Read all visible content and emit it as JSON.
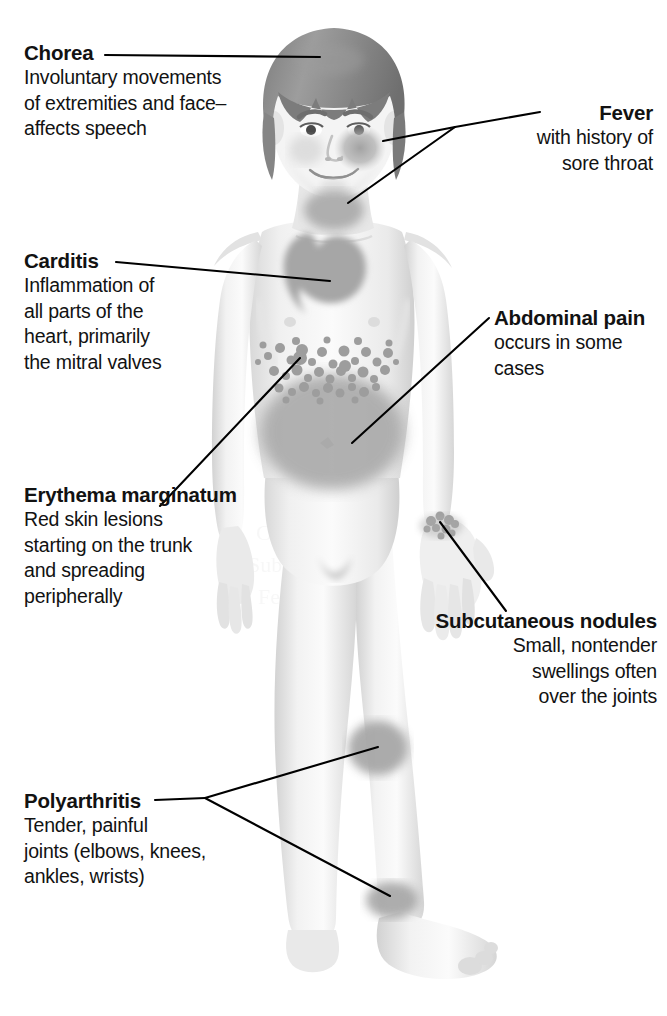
{
  "diagram": {
    "style": "grayscale medical illustration with leader-line callouts",
    "background_color": "#ffffff",
    "text_color": "#121212",
    "leader_line_color": "#000000",
    "patch_color": "#a9a9a9",
    "skin_color": "#f2f2f2",
    "hair_color": "#8f8f8f"
  },
  "callouts": [
    {
      "id": "chorea",
      "title": "Chorea",
      "body_lines": [
        "Involuntary movements",
        "of extremities and face–",
        "affects speech"
      ],
      "align": "left",
      "target": "head-hair"
    },
    {
      "id": "fever",
      "title": "Fever",
      "body_lines": [
        "with history of",
        "sore throat"
      ],
      "align": "right",
      "target": "cheek-and-throat"
    },
    {
      "id": "carditis",
      "title": "Carditis",
      "body_lines": [
        "Inflammation of",
        "all parts of the",
        "heart, primarily",
        "the mitral valves"
      ],
      "align": "left",
      "target": "heart"
    },
    {
      "id": "abdominal-pain",
      "title": "Abdominal pain",
      "body_lines": [
        "occurs in some",
        "cases"
      ],
      "align": "left",
      "target": "abdomen"
    },
    {
      "id": "erythema-marginatum",
      "title_lines": [
        "Erythema",
        "marginatum"
      ],
      "title": "Erythema marginatum",
      "body_lines": [
        "Red skin lesions",
        "starting on the trunk",
        "and spreading",
        "peripherally"
      ],
      "align": "left",
      "target": "trunk-rash"
    },
    {
      "id": "subcutaneous-nodules",
      "title_lines": [
        "Subcutaneous",
        "nodules"
      ],
      "title": "Subcutaneous nodules",
      "body_lines": [
        "Small, nontender",
        "swellings often",
        "over the joints"
      ],
      "align": "right",
      "target": "wrist-nodules"
    },
    {
      "id": "polyarthritis",
      "title": "Polyarthritis",
      "body_lines": [
        "Tender, painful",
        "joints (elbows, knees,",
        "ankles, wrists)"
      ],
      "align": "left",
      "target": "knee-and-ankle"
    }
  ],
  "chorea": {
    "title": "Chorea",
    "l1": "Involuntary movements",
    "l2": "of extremities and face–",
    "l3": "affects speech"
  },
  "fever": {
    "title": "Fever",
    "l1": "with history of",
    "l2": "sore throat"
  },
  "carditis": {
    "title": "Carditis",
    "l1": "Inflammation of",
    "l2": "all parts of the",
    "l3": "heart, primarily",
    "l4": "the mitral valves"
  },
  "abdominal": {
    "title": "Abdominal pain",
    "l1": "occurs in some",
    "l2": "cases"
  },
  "erythema": {
    "title1": "Erythema",
    "title2": "marginatum",
    "l1": "Red skin lesions",
    "l2": "starting on the trunk",
    "l3": "and spreading",
    "l4": "peripherally"
  },
  "nodules": {
    "title1": "Subcutaneous",
    "title2": "nodules",
    "l1": "Small, nontender",
    "l2": "swellings often",
    "l3": "over the joints"
  },
  "polyarthritis": {
    "title": "Polyarthritis",
    "l1": "Tender, painful",
    "l2": "joints (elbows, knees,",
    "l3": "ankles, wrists)"
  }
}
